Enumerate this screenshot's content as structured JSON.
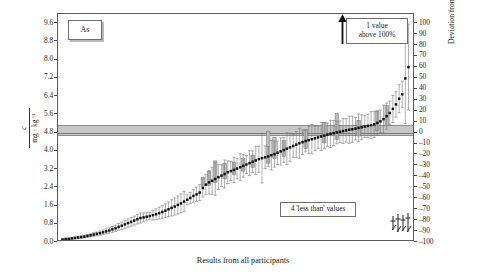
{
  "figure": {
    "analyte_label": "As",
    "xlabel": "Results from all participants",
    "ylabel_left_numerator": "c",
    "ylabel_left_denominator": "mg · kg⁻¹",
    "ylabel_right": "Deviation from the certified value in %",
    "annotation_above": "1 value",
    "annotation_above_2": "above 100%",
    "annotation_lessthan": "4 'less than' values"
  },
  "chart_data": {
    "type": "scatter",
    "xlabel": "Results from all participants",
    "ylabel": "c / mg · kg⁻¹",
    "ylabel_secondary": "Deviation from the certified value in %",
    "ylim": [
      0.0,
      10.0
    ],
    "yticks": [
      0.0,
      0.8,
      1.6,
      2.4,
      3.2,
      4.0,
      4.8,
      5.6,
      6.4,
      7.2,
      8.0,
      8.8,
      9.6
    ],
    "ytick_labels": [
      "0.0",
      "0.8",
      "1.6",
      "2.4",
      "3.2",
      "4.0",
      "4.8",
      "5.6",
      "6.4",
      "7.2",
      "8.0",
      "8.8",
      "9.6"
    ],
    "ylim_secondary": [
      -100,
      100
    ],
    "yticks_secondary": [
      100,
      90,
      80,
      70,
      60,
      50,
      40,
      30,
      20,
      10,
      0,
      -10,
      -20,
      -30,
      -40,
      -50,
      -60,
      -70,
      -80,
      -90,
      -100
    ],
    "ytick_labels_secondary": [
      "100",
      "90",
      "80",
      "70",
      "60",
      "50",
      "40",
      "30",
      "20",
      "10",
      "0",
      "–10",
      "–20",
      "–30",
      "–40",
      "–50",
      "–60",
      "–70",
      "–80",
      "–90",
      "–100"
    ],
    "certified_value": 4.8,
    "certified_band": [
      4.65,
      5.12
    ],
    "grid": false,
    "legend": false,
    "n_points": 112,
    "notes": [
      "1 value above 100%",
      "4 'less than' values"
    ],
    "values": [
      0.02,
      0.04,
      0.05,
      0.07,
      0.09,
      0.11,
      0.13,
      0.15,
      0.18,
      0.21,
      0.24,
      0.27,
      0.3,
      0.34,
      0.38,
      0.42,
      0.47,
      0.52,
      0.58,
      0.63,
      0.69,
      0.75,
      0.8,
      0.86,
      0.92,
      0.97,
      1.0,
      1.03,
      1.06,
      1.1,
      1.14,
      1.19,
      1.24,
      1.3,
      1.36,
      1.42,
      1.48,
      1.55,
      1.62,
      1.7,
      1.78,
      1.86,
      1.95,
      2.02,
      2.1,
      2.3,
      2.45,
      2.55,
      2.62,
      2.7,
      2.78,
      2.85,
      2.92,
      3.0,
      3.05,
      3.1,
      3.16,
      3.22,
      3.28,
      3.34,
      3.4,
      3.46,
      3.52,
      3.58,
      3.62,
      3.66,
      3.7,
      3.75,
      3.8,
      3.86,
      3.92,
      3.98,
      4.04,
      4.1,
      4.16,
      4.22,
      4.28,
      4.33,
      4.38,
      4.42,
      4.46,
      4.5,
      4.54,
      4.58,
      4.62,
      4.66,
      4.7,
      4.73,
      4.76,
      4.79,
      4.82,
      4.85,
      4.88,
      4.9,
      4.93,
      4.96,
      4.99,
      5.02,
      5.05,
      5.08,
      5.12,
      5.18,
      5.25,
      5.35,
      5.48,
      5.62,
      5.8,
      6.0,
      6.25,
      6.45,
      7.15,
      7.65
    ],
    "errors": [
      0.03,
      0.03,
      0.03,
      0.04,
      0.04,
      0.05,
      0.05,
      0.06,
      0.06,
      0.07,
      0.08,
      0.08,
      0.09,
      0.1,
      0.11,
      0.12,
      0.13,
      0.14,
      0.15,
      0.16,
      0.17,
      0.18,
      0.19,
      0.2,
      0.21,
      0.22,
      0.2,
      0.18,
      0.16,
      0.22,
      0.24,
      0.26,
      0.28,
      0.3,
      0.33,
      0.36,
      0.38,
      0.4,
      0.42,
      0.45,
      0.22,
      0.25,
      0.28,
      0.32,
      0.35,
      0.4,
      0.45,
      0.52,
      0.6,
      0.72,
      0.55,
      0.48,
      0.62,
      0.5,
      0.42,
      0.56,
      0.45,
      0.6,
      0.5,
      0.4,
      0.55,
      0.48,
      0.62,
      0.58,
      1.1,
      0.5,
      0.44,
      0.65,
      0.58,
      0.52,
      0.6,
      0.55,
      0.7,
      0.62,
      0.5,
      0.58,
      0.66,
      0.54,
      0.48,
      0.6,
      0.65,
      0.55,
      0.5,
      0.62,
      0.58,
      0.52,
      0.6,
      0.56,
      0.5,
      0.48,
      0.55,
      0.52,
      0.6,
      0.58,
      0.5,
      0.62,
      0.55,
      0.48,
      0.52,
      0.6,
      0.58,
      0.55,
      0.5,
      0.62,
      0.58,
      0.52,
      0.6,
      0.56,
      0.62,
      0.58,
      2.0,
      1.9
    ],
    "boxes": [
      {
        "index": 45,
        "low": 2.38,
        "high": 2.78
      },
      {
        "index": 47,
        "low": 2.42,
        "high": 3.05
      },
      {
        "index": 49,
        "low": 2.55,
        "high": 3.5
      },
      {
        "index": 52,
        "low": 2.7,
        "high": 3.4
      },
      {
        "index": 55,
        "low": 2.9,
        "high": 3.45
      },
      {
        "index": 58,
        "low": 3.05,
        "high": 3.6
      },
      {
        "index": 61,
        "low": 3.2,
        "high": 3.75
      },
      {
        "index": 66,
        "low": 3.4,
        "high": 4.8
      },
      {
        "index": 68,
        "low": 3.6,
        "high": 4.55
      },
      {
        "index": 71,
        "low": 3.7,
        "high": 4.4
      },
      {
        "index": 78,
        "low": 4.05,
        "high": 4.9
      },
      {
        "index": 84,
        "low": 4.3,
        "high": 5.2
      },
      {
        "index": 88,
        "low": 4.45,
        "high": 5.6
      },
      {
        "index": 95,
        "low": 4.6,
        "high": 5.3
      },
      {
        "index": 101,
        "low": 4.85,
        "high": 5.7
      },
      {
        "index": 104,
        "low": 5.05,
        "high": 5.95
      }
    ]
  }
}
